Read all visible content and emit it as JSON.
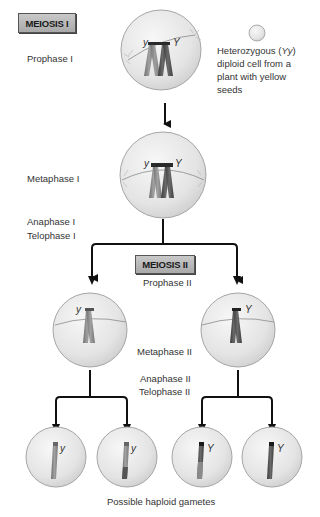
{
  "headers": {
    "meiosis_1": "MEIOSIS I",
    "meiosis_2": "MEIOSIS II"
  },
  "stages": {
    "prophase_1": "Prophase I",
    "metaphase_1": "Metaphase I",
    "anaphase_1": "Anaphase I",
    "telophase_1": "Telophase I",
    "prophase_2": "Prophase II",
    "metaphase_2": "Metaphase II",
    "anaphase_2": "Anaphase II",
    "telophase_2": "Telophase II"
  },
  "legend": {
    "line_1_pre": "Heterozygous (",
    "line_1_allele": "Yy",
    "line_1_post": ")",
    "line_2": "diploid cell from a",
    "line_3": "plant with yellow",
    "line_4": "seeds"
  },
  "alleles": {
    "recessive": "y",
    "dominant": "Y"
  },
  "gametes": [
    {
      "allele": "y"
    },
    {
      "allele": "y"
    },
    {
      "allele": "Y"
    },
    {
      "allele": "Y"
    }
  ],
  "caption": "Possible haploid gametes",
  "colors": {
    "header_box": "#b5b5b5",
    "cell_fill": "#e6e6e6",
    "cell_stroke": "#9a9a9a",
    "chromosome_light": "#8a8a8a",
    "chromosome_dark": "#4a4a4a",
    "arrow": "#111111"
  }
}
